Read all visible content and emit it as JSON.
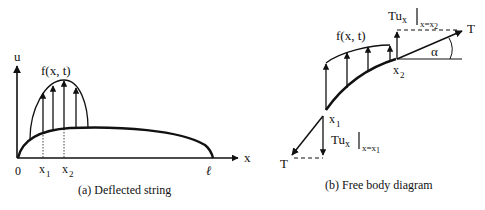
{
  "panel_a": {
    "axis_u_label": "u",
    "axis_x_label": "x",
    "load_label": "f(x, t)",
    "origin_label": "0",
    "x1_label": "x",
    "x1_sub": "1",
    "x2_label": "x",
    "x2_sub": "2",
    "end_label": "ℓ",
    "caption": "(a)  Deflected string"
  },
  "panel_b": {
    "load_label": "f(x, t)",
    "x1_label": "x",
    "x1_sub": "1",
    "x2_label": "x",
    "x2_sub": "2",
    "tension_right_label": "T",
    "tension_left_label": "T",
    "angle_label": "α",
    "shear_top_main": "Tu",
    "shear_top_sub": "x",
    "shear_top_eval": "x=x",
    "shear_top_eval_sub": "2",
    "shear_bottom_main": "Tu",
    "shear_bottom_sub": "x",
    "shear_bottom_eval": "x=x",
    "shear_bottom_eval_sub": "1",
    "caption": "(b)  Free body diagram"
  },
  "colors": {
    "ink": "#111111",
    "background": "#ffffff"
  }
}
